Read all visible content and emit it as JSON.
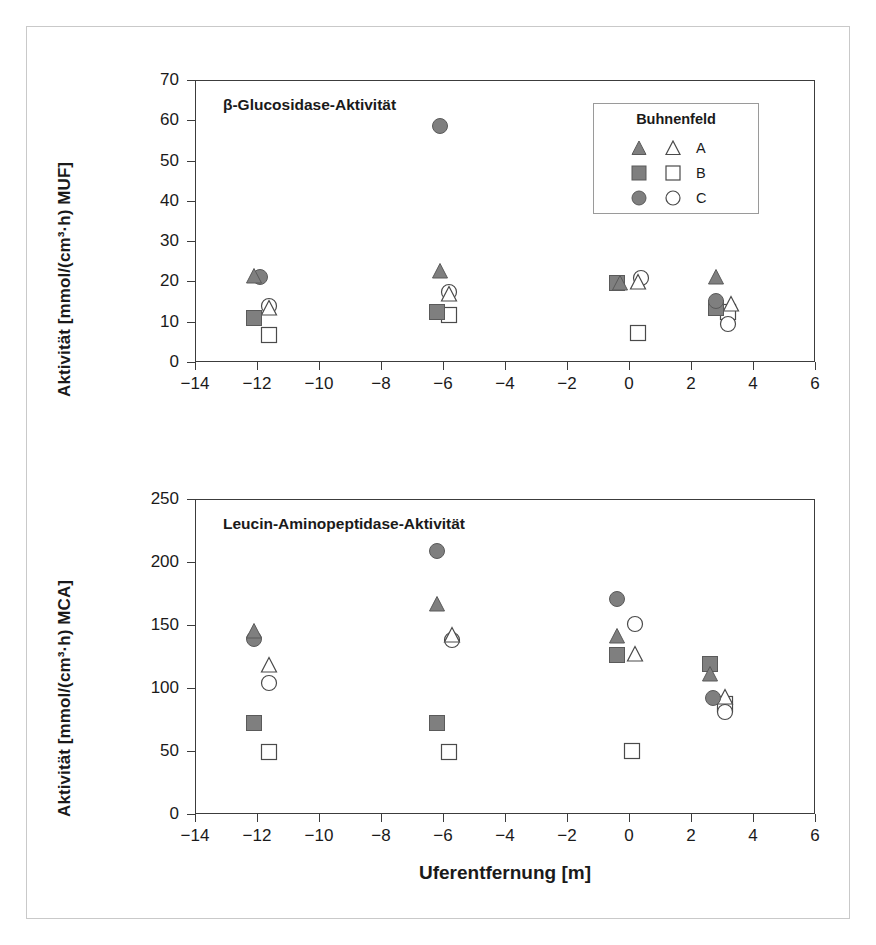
{
  "figure": {
    "border_color": "#c9c9c9",
    "background": "#ffffff",
    "fill_color": "#7f7f7f",
    "line_color": "#3c3c3c"
  },
  "axis": {
    "xlabel": "Uferentfernung [m]",
    "x_ticks": [
      "-14",
      "-12",
      "-10",
      "-8",
      "-6",
      "-4",
      "-2",
      "0",
      "2",
      "4",
      "6"
    ],
    "top_y_ticks": [
      "0",
      "10",
      "20",
      "30",
      "40",
      "50",
      "60",
      "70"
    ],
    "bottom_y_ticks": [
      "0",
      "50",
      "100",
      "150",
      "200",
      "250"
    ]
  },
  "legend": {
    "title": "Buhnenfeld",
    "entries": [
      {
        "label": "A",
        "shape": "triangle"
      },
      {
        "label": "B",
        "shape": "square"
      },
      {
        "label": "C",
        "shape": "circle"
      }
    ]
  },
  "chart_data": [
    {
      "type": "scatter",
      "panel": "top",
      "title": "β-Glucosidase-Aktivität",
      "xlabel": "",
      "ylabel": "Aktivität [mmol/(cm³·h) MUF]",
      "xlim": [
        -14,
        6
      ],
      "ylim": [
        0,
        70
      ],
      "xticks": [
        -14,
        -12,
        -10,
        -8,
        -6,
        -4,
        -2,
        0,
        2,
        4,
        6
      ],
      "yticks": [
        0,
        10,
        20,
        30,
        40,
        50,
        60,
        70
      ],
      "grid": false,
      "series": [
        {
          "name": "A filled",
          "shape": "triangle",
          "fill": "filled",
          "points": [
            [
              -12.1,
              21.3
            ],
            [
              -6.1,
              22.6
            ],
            [
              -0.3,
              19.7
            ],
            [
              2.8,
              21.0
            ]
          ]
        },
        {
          "name": "A open",
          "shape": "triangle",
          "fill": "open",
          "points": [
            [
              -11.6,
              13.3
            ],
            [
              -5.8,
              17.0
            ],
            [
              0.3,
              19.8
            ],
            [
              3.3,
              14.5
            ]
          ]
        },
        {
          "name": "B filled",
          "shape": "square",
          "fill": "filled",
          "points": [
            [
              -12.1,
              11.0
            ],
            [
              -6.2,
              12.5
            ],
            [
              -0.4,
              19.6
            ],
            [
              2.8,
              13.4
            ]
          ]
        },
        {
          "name": "B open",
          "shape": "square",
          "fill": "open",
          "points": [
            [
              -11.6,
              6.8
            ],
            [
              -5.8,
              11.6
            ],
            [
              0.3,
              7.2
            ],
            [
              3.2,
              12.3
            ]
          ]
        },
        {
          "name": "C filled",
          "shape": "circle",
          "fill": "filled",
          "points": [
            [
              -11.9,
              21.2
            ],
            [
              -6.1,
              58.6
            ],
            [
              -0.3,
              58.1
            ],
            [
              2.8,
              15.2
            ]
          ]
        },
        {
          "name": "C open",
          "shape": "circle",
          "fill": "open",
          "points": [
            [
              -11.6,
              13.9
            ],
            [
              -5.8,
              17.5
            ],
            [
              0.4,
              20.8
            ],
            [
              3.2,
              9.5
            ]
          ]
        }
      ]
    },
    {
      "type": "scatter",
      "panel": "bottom",
      "title": "Leucin-Aminopeptidase-Aktivität",
      "xlabel": "Uferentfernung [m]",
      "ylabel": "Aktivität [mmol/(cm³·h) MCA]",
      "xlim": [
        -14,
        6
      ],
      "ylim": [
        0,
        250
      ],
      "xticks": [
        -14,
        -12,
        -10,
        -8,
        -6,
        -4,
        -2,
        0,
        2,
        4,
        6
      ],
      "yticks": [
        0,
        50,
        100,
        150,
        200,
        250
      ],
      "grid": false,
      "series": [
        {
          "name": "A filled",
          "shape": "triangle",
          "fill": "filled",
          "points": [
            [
              -12.1,
              145
            ],
            [
              -6.2,
              167
            ],
            [
              -0.4,
              141
            ],
            [
              2.6,
              111
            ]
          ]
        },
        {
          "name": "A open",
          "shape": "triangle",
          "fill": "open",
          "points": [
            [
              -11.6,
              118
            ],
            [
              -5.7,
              142
            ],
            [
              0.2,
              127
            ],
            [
              3.1,
              93
            ]
          ]
        },
        {
          "name": "B filled",
          "shape": "square",
          "fill": "filled",
          "points": [
            [
              -12.1,
              72
            ],
            [
              -6.2,
              72
            ],
            [
              -0.4,
              126
            ],
            [
              2.6,
              119
            ]
          ]
        },
        {
          "name": "B open",
          "shape": "square",
          "fill": "open",
          "points": [
            [
              -11.6,
              49
            ],
            [
              -5.8,
              49
            ],
            [
              0.1,
              50
            ],
            [
              3.1,
              87
            ]
          ]
        },
        {
          "name": "C filled",
          "shape": "circle",
          "fill": "filled",
          "points": [
            [
              -12.1,
              139
            ],
            [
              -6.2,
              209
            ],
            [
              -0.4,
              171
            ],
            [
              2.7,
              92
            ]
          ]
        },
        {
          "name": "C open",
          "shape": "circle",
          "fill": "open",
          "points": [
            [
              -11.6,
              104
            ],
            [
              -5.7,
              138
            ],
            [
              0.2,
              151
            ],
            [
              3.1,
              81
            ]
          ]
        }
      ]
    }
  ]
}
